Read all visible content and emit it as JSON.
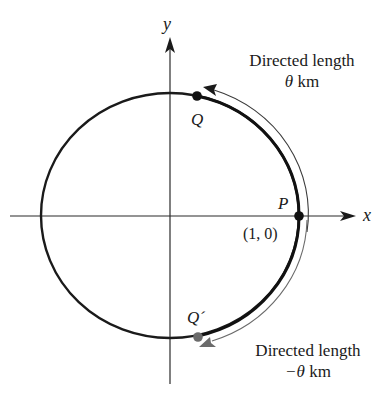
{
  "figure": {
    "axes": {
      "x_label": "x",
      "y_label": "y"
    },
    "points": {
      "P": {
        "label": "P",
        "coord_label": "(1, 0)"
      },
      "Q": {
        "label": "Q"
      },
      "Q_prime": {
        "label": "Q´"
      }
    },
    "annotations": {
      "upper": {
        "line1": "Directed length",
        "line2_symbol": "θ",
        "line2_unit": "km"
      },
      "lower": {
        "line1": "Directed length",
        "line2_symbol": "−θ",
        "line2_unit": "km"
      }
    },
    "colors": {
      "ink": "#1a1a1a",
      "axis": "#2b2b2b",
      "q_prime_point": "#6b6b6b",
      "lower_arrow": "#6b6b6b",
      "upper_arrow": "#3a3a3a"
    }
  }
}
